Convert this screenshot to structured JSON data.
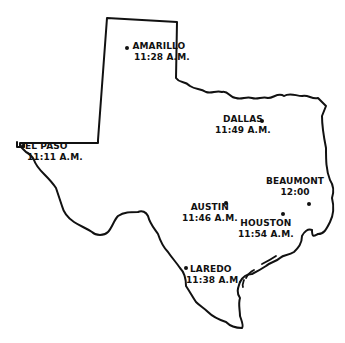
{
  "map": {
    "region": "Texas",
    "outline_color": "#111111",
    "background": "#ffffff"
  },
  "cities": [
    {
      "id": "amarillo",
      "name": "AMARILLO",
      "time": "11:28 A.M."
    },
    {
      "id": "el-paso",
      "name": "EL PASO",
      "time": "11:11 A.M."
    },
    {
      "id": "dallas",
      "name": "DALLAS",
      "time": "11:49 A.M."
    },
    {
      "id": "beaumont",
      "name": "BEAUMONT",
      "time": "12:00"
    },
    {
      "id": "austin",
      "name": "AUSTIN",
      "time": "11:46 A.M."
    },
    {
      "id": "houston",
      "name": "HOUSTON",
      "time": "11:54 A.M."
    },
    {
      "id": "laredo",
      "name": "LAREDO",
      "time": "11:38 A.M."
    }
  ]
}
